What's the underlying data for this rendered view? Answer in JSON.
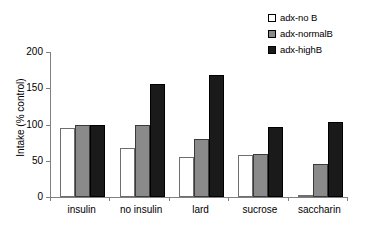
{
  "chart_data": {
    "type": "bar",
    "title": "",
    "xlabel": "",
    "ylabel": "Intake (% control)",
    "ylim": [
      0,
      200
    ],
    "yticks": [
      0,
      50,
      100,
      150,
      200
    ],
    "grid": false,
    "legend_position": "top-right",
    "categories": [
      "insulin",
      "no insulin",
      "lard",
      "sucrose",
      "saccharin"
    ],
    "series": [
      {
        "name": "adx-no B",
        "color": "#ffffff",
        "values": [
          95,
          67,
          55,
          58,
          3
        ]
      },
      {
        "name": "adx-normalB",
        "color": "#8a8a8a",
        "values": [
          100,
          99,
          80,
          60,
          45
        ]
      },
      {
        "name": "adx-highB",
        "color": "#1a1a1a",
        "values": [
          99,
          156,
          168,
          97,
          103
        ]
      }
    ]
  },
  "legend": {
    "items": [
      {
        "label": "adx-no B"
      },
      {
        "label": "adx-normalB"
      },
      {
        "label": "adx-highB"
      }
    ]
  },
  "axes": {
    "y_title": "Intake (% control)",
    "y_tick_labels": [
      "200",
      "150",
      "100",
      "50",
      "0"
    ],
    "x_tick_labels": [
      "insulin",
      "no insulin",
      "lard",
      "sucrose",
      "saccharin"
    ]
  }
}
